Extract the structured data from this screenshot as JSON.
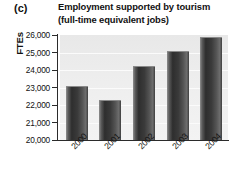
{
  "panel": {
    "letter": "(c)"
  },
  "chart_data": {
    "type": "bar",
    "title": "Employment supported by tourism (full-time equivalent jobs)",
    "title_lines": [
      "Employment supported by tourism",
      "(full-time equivalent jobs)"
    ],
    "xlabel": "",
    "ylabel": "FTEs",
    "categories": [
      "2000",
      "2001",
      "2002",
      "2003",
      "2004"
    ],
    "values": [
      23100,
      22300,
      24250,
      25100,
      25900
    ],
    "ylim": [
      20000,
      26000
    ],
    "yticks": [
      26000,
      25000,
      24000,
      23000,
      22000,
      21000,
      20000
    ],
    "ytick_labels": [
      "26,000",
      "25,000",
      "24,000",
      "23,000",
      "22,000",
      "21,000",
      "20,000"
    ],
    "grid": true,
    "legend": false,
    "bar_color": "#3a3a3a",
    "plot_background": "#eeeeee"
  }
}
